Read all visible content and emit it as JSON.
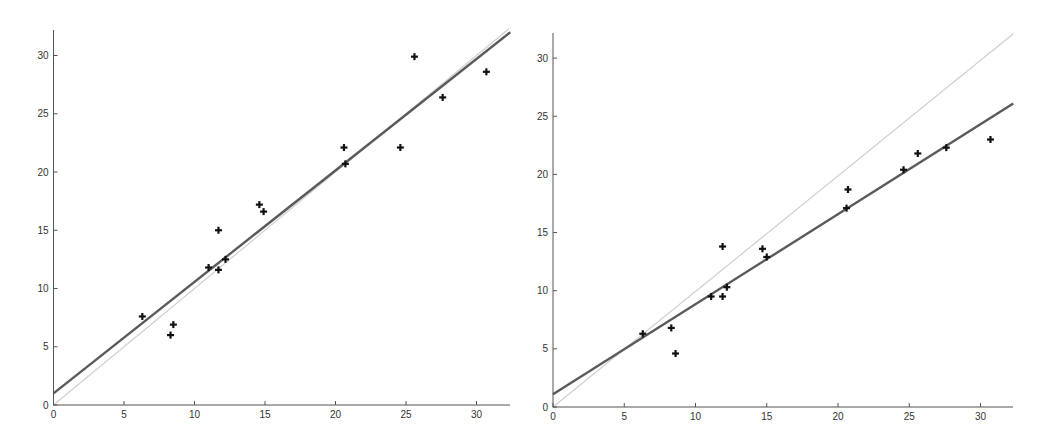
{
  "colors": {
    "background": "#ffffff",
    "axis": "#555555",
    "fit_line": "#5a5a5a",
    "identity_line": "#cfcfcf",
    "marker": "#111111",
    "tick_label": "#333333"
  },
  "chart_data": [
    {
      "type": "scatter",
      "title": "",
      "xlabel": "",
      "ylabel": "",
      "xlim": [
        0,
        32.3
      ],
      "ylim": [
        0,
        32.2
      ],
      "xticks": [
        0,
        5,
        10,
        15,
        20,
        25,
        30
      ],
      "yticks": [
        0,
        5,
        10,
        15,
        20,
        25,
        30
      ],
      "grid": false,
      "legend": null,
      "frame": {
        "x0": 53.5,
        "y0": 405,
        "x1": 510,
        "y1": 30,
        "px_per_x": 14.1,
        "px_per_y": 11.65
      },
      "points": {
        "marker": "plus",
        "x": [
          6.3,
          8.3,
          8.5,
          11.0,
          11.7,
          11.7,
          12.2,
          14.6,
          14.9,
          20.6,
          20.7,
          24.6,
          25.6,
          27.6,
          30.7
        ],
        "y": [
          7.6,
          6.0,
          6.9,
          11.8,
          15.0,
          11.6,
          12.5,
          17.2,
          16.6,
          22.1,
          20.7,
          22.1,
          29.9,
          26.4,
          28.6
        ]
      },
      "lines": [
        {
          "name": "identity (y = x)",
          "style": "light",
          "x": [
            0,
            32.3
          ],
          "y": [
            0,
            32.3
          ]
        },
        {
          "name": "fitted line",
          "style": "dark",
          "x": [
            0,
            32.4
          ],
          "y": [
            1.0,
            32.0
          ]
        }
      ]
    },
    {
      "type": "scatter",
      "title": "",
      "xlabel": "",
      "ylabel": "",
      "xlim": [
        0,
        32.3
      ],
      "ylim": [
        0,
        32.2
      ],
      "xticks": [
        0,
        5,
        10,
        15,
        20,
        25,
        30
      ],
      "yticks": [
        0,
        5,
        10,
        15,
        20,
        25,
        30
      ],
      "grid": false,
      "legend": null,
      "frame": {
        "x0": 553,
        "y0": 407,
        "x1": 1013,
        "y1": 33,
        "px_per_x": 14.25,
        "px_per_y": 11.63
      },
      "points": {
        "marker": "plus",
        "x": [
          6.3,
          8.3,
          8.6,
          11.1,
          11.9,
          11.9,
          12.2,
          14.7,
          15.0,
          20.6,
          20.7,
          24.6,
          25.6,
          27.6,
          30.7
        ],
        "y": [
          6.3,
          6.8,
          4.6,
          9.5,
          13.8,
          9.5,
          10.3,
          13.6,
          12.9,
          17.1,
          18.7,
          20.4,
          21.8,
          22.3,
          23.0
        ]
      },
      "lines": [
        {
          "name": "identity (y = x)",
          "style": "light",
          "x": [
            0,
            32.3
          ],
          "y": [
            0,
            32.1
          ]
        },
        {
          "name": "fitted line",
          "style": "dark",
          "x": [
            0,
            32.3
          ],
          "y": [
            1.1,
            26.1
          ]
        }
      ]
    }
  ]
}
